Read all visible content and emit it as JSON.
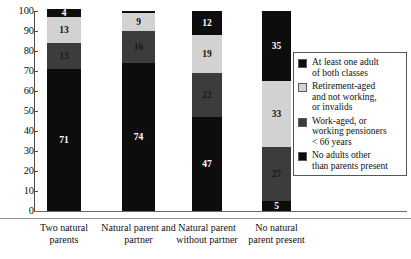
{
  "chart_data": {
    "type": "bar",
    "stacked": true,
    "title": "",
    "xlabel": "",
    "ylabel": "",
    "ylim": [
      0,
      100
    ],
    "yticks": [
      0,
      10,
      20,
      30,
      40,
      50,
      60,
      70,
      80,
      90,
      100
    ],
    "grid": false,
    "legend_position": "right",
    "categories": [
      "Two natural parents",
      "Natural parent and partner",
      "Natural parent without partner",
      "No natural parent present"
    ],
    "series": [
      {
        "name": "No adults other than parents present",
        "color": "#0d0d0d",
        "values": [
          71,
          74,
          47,
          5
        ],
        "labels": [
          "71",
          "74",
          "47",
          "5"
        ]
      },
      {
        "name": "Work-aged, or working pensioners < 66 years",
        "color": "#3c3c3c",
        "values": [
          13,
          16,
          22,
          27
        ],
        "labels": [
          "13",
          "16",
          "22",
          "27"
        ]
      },
      {
        "name": "Retirement-aged and not working, or invalids",
        "color": "#d2d2d2",
        "values": [
          13,
          9,
          19,
          33
        ],
        "labels": [
          "13",
          "9",
          "19",
          "33"
        ]
      },
      {
        "name": "At least one adult of both classes",
        "color": "#0d0d0d",
        "values": [
          4,
          1,
          12,
          35
        ],
        "labels": [
          "4",
          "",
          "12",
          "35"
        ]
      }
    ]
  },
  "axis": {
    "y_ticks": [
      "100",
      "90",
      "80",
      "70",
      "60",
      "50",
      "40",
      "30",
      "20",
      "10",
      "0"
    ]
  },
  "categories": [
    {
      "line1": "Two natural",
      "line2": "parents"
    },
    {
      "line1": "Natural parent and",
      "line2": "partner"
    },
    {
      "line1": "Natural parent",
      "line2": "without partner"
    },
    {
      "line1": "No natural",
      "line2": "parent present"
    }
  ],
  "bars": [
    {
      "name": "two-natural-parents",
      "segments": [
        {
          "key": "both-classes",
          "value": 4,
          "label": "4",
          "swatch": "black"
        },
        {
          "key": "retirement-aged",
          "value": 13,
          "label": "13",
          "swatch": "light"
        },
        {
          "key": "work-aged",
          "value": 13,
          "label": "13",
          "swatch": "dark"
        },
        {
          "key": "no-other-adults",
          "value": 71,
          "label": "71",
          "swatch": "black"
        }
      ]
    },
    {
      "name": "natural-parent-and-partner",
      "segments": [
        {
          "key": "both-classes",
          "value": 1,
          "label": "",
          "swatch": "black"
        },
        {
          "key": "retirement-aged",
          "value": 9,
          "label": "9",
          "swatch": "light"
        },
        {
          "key": "work-aged",
          "value": 16,
          "label": "16",
          "swatch": "dark"
        },
        {
          "key": "no-other-adults",
          "value": 74,
          "label": "74",
          "swatch": "black"
        }
      ]
    },
    {
      "name": "natural-parent-without-partner",
      "segments": [
        {
          "key": "both-classes",
          "value": 12,
          "label": "12",
          "swatch": "black"
        },
        {
          "key": "retirement-aged",
          "value": 19,
          "label": "19",
          "swatch": "light"
        },
        {
          "key": "work-aged",
          "value": 22,
          "label": "22",
          "swatch": "dark"
        },
        {
          "key": "no-other-adults",
          "value": 47,
          "label": "47",
          "swatch": "black"
        }
      ]
    },
    {
      "name": "no-natural-parent-present",
      "segments": [
        {
          "key": "both-classes",
          "value": 35,
          "label": "35",
          "swatch": "black"
        },
        {
          "key": "retirement-aged",
          "value": 33,
          "label": "33",
          "swatch": "light"
        },
        {
          "key": "work-aged",
          "value": 27,
          "label": "27",
          "swatch": "dark"
        },
        {
          "key": "no-other-adults",
          "value": 5,
          "label": "5",
          "swatch": "black"
        }
      ]
    }
  ],
  "legend": {
    "items": [
      {
        "swatch": "black",
        "color": "#0d0d0d",
        "lines": [
          "At least one adult",
          "of both classes"
        ]
      },
      {
        "swatch": "light",
        "color": "#d2d2d2",
        "lines": [
          "Retirement-aged",
          "and not working,",
          "or invalids"
        ]
      },
      {
        "swatch": "dark",
        "color": "#3c3c3c",
        "lines": [
          "Work-aged, or",
          "working pensioners",
          "< 66 years"
        ]
      },
      {
        "swatch": "black",
        "color": "#0d0d0d",
        "lines": [
          "No adults other",
          "than parents present"
        ]
      }
    ]
  }
}
